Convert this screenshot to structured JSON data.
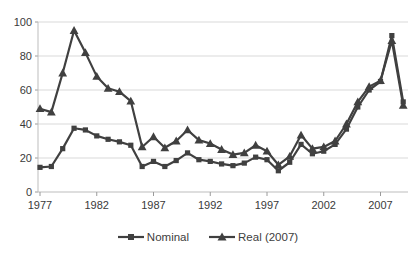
{
  "chart_data": {
    "type": "line",
    "x": [
      1977,
      1978,
      1979,
      1980,
      1981,
      1982,
      1983,
      1984,
      1985,
      1986,
      1987,
      1988,
      1989,
      1990,
      1991,
      1992,
      1993,
      1994,
      1995,
      1996,
      1997,
      1998,
      1999,
      2000,
      2001,
      2002,
      2003,
      2004,
      2005,
      2006,
      2007,
      2008,
      2009
    ],
    "series": [
      {
        "name": "Nominal",
        "marker": "square",
        "values": [
          14.5,
          15,
          25.5,
          37.5,
          36.5,
          33,
          31,
          29.5,
          27.5,
          15,
          18,
          15,
          18.5,
          23,
          19,
          18,
          16.5,
          15.5,
          17,
          20.5,
          19,
          12.5,
          17.5,
          28,
          22.5,
          24,
          28,
          37,
          50,
          60,
          65,
          92,
          53
        ]
      },
      {
        "name": "Real (2007)",
        "marker": "triangle",
        "values": [
          49,
          47,
          70,
          95,
          82,
          68,
          61,
          59,
          53.5,
          26.5,
          32.5,
          26,
          30,
          36.5,
          30.5,
          28.5,
          25,
          22,
          23,
          27.5,
          24,
          16,
          21,
          33.5,
          25.5,
          26.5,
          30,
          40,
          53,
          62,
          65.5,
          89,
          51
        ]
      }
    ],
    "title": "",
    "xlabel": "",
    "ylabel": "",
    "ylim": [
      0,
      100
    ],
    "yticks": [
      0,
      20,
      40,
      60,
      80,
      100
    ],
    "xticks": [
      1977,
      1982,
      1987,
      1992,
      1997,
      2002,
      2007
    ],
    "grid": "horizontal",
    "legend_position": "bottom",
    "line_color": "#404040",
    "gridline_color": "#d9d9d9",
    "axis_color": "#bdbdbd",
    "tick_color": "#9a9a9a",
    "text_color": "#3a3a3a",
    "background_color": "#ffffff"
  }
}
